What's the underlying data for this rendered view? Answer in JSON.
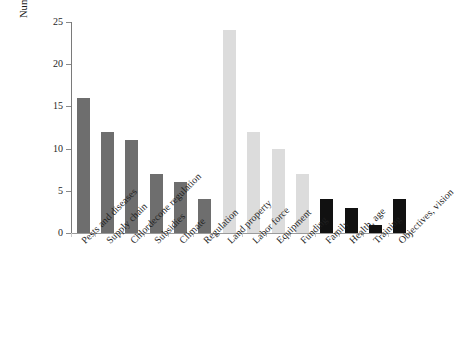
{
  "chart_data": {
    "type": "bar",
    "title": "",
    "subtitle": "",
    "xlabel": "",
    "ylabel": "Number of farmers",
    "ylim": [
      0,
      25
    ],
    "yticks": [
      0,
      5,
      10,
      15,
      20,
      25
    ],
    "grid": false,
    "legend": null,
    "categories": [
      "Pests and diseases",
      "Supply chain",
      "Chlordecone regulation",
      "Subsidies",
      "Climate",
      "Regulation",
      "Land property",
      "Labor force",
      "Equipment",
      "Funding",
      "Family",
      "Health, age",
      "Training",
      "Objectives, vision"
    ],
    "values": [
      16,
      12,
      11,
      7,
      6,
      4,
      24,
      12,
      10,
      7,
      4,
      3,
      1,
      4
    ],
    "bar_colors": [
      "#6e6e6e",
      "#6e6e6e",
      "#6e6e6e",
      "#6e6e6e",
      "#6e6e6e",
      "#6e6e6e",
      "#dcdcdc",
      "#dcdcdc",
      "#dcdcdc",
      "#dcdcdc",
      "#111111",
      "#111111",
      "#111111",
      "#111111"
    ],
    "group_colors": {
      "dark_gray": "#6e6e6e",
      "light_gray": "#dcdcdc",
      "black": "#111111"
    },
    "axis_color": "#8a8a8a",
    "background": "#ffffff"
  }
}
